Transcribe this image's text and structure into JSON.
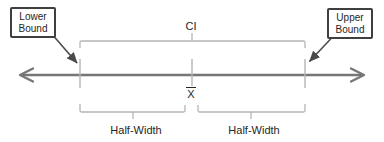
{
  "labels": {
    "ci": "CI",
    "mean": "X",
    "half_width_left": "Half-Width",
    "half_width_right": "Half-Width",
    "lower_bound": "Lower\nBound",
    "upper_bound": "Upper\nBound"
  },
  "colors": {
    "background": "#ffffff",
    "axis_line": "#767676",
    "bracket_line": "#b5b5b5",
    "tick_line": "#b5b5b5",
    "pointer_line": "#4a4a4a",
    "box_border": "#3f3f3f",
    "text": "#262626"
  }
}
